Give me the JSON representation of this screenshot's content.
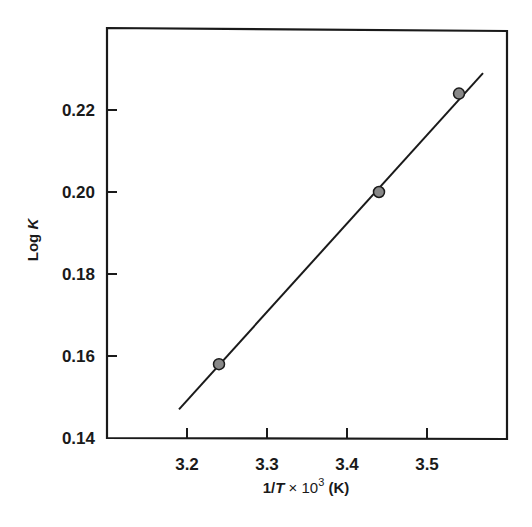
{
  "chart_data": {
    "type": "scatter",
    "title": "",
    "xlabel": "1/T × 10³ (K)",
    "ylabel": "Log K",
    "xlim": [
      3.1,
      3.6
    ],
    "ylim": [
      0.14,
      0.24
    ],
    "xticks": [
      3.2,
      3.3,
      3.4,
      3.5
    ],
    "xtick_labels": [
      "3.2",
      "3.3",
      "3.4",
      "3.5"
    ],
    "yticks": [
      0.14,
      0.16,
      0.18,
      0.2,
      0.22
    ],
    "ytick_labels": [
      "0.14",
      "0.16",
      "0.18",
      "0.20",
      "0.22"
    ],
    "grid": false,
    "legend": null,
    "series": [
      {
        "name": "measured",
        "type": "scatter",
        "x": [
          3.24,
          3.44,
          3.54
        ],
        "y": [
          0.158,
          0.2,
          0.224
        ],
        "marker_color": "#888888"
      },
      {
        "name": "linear fit",
        "type": "line",
        "x": [
          3.19,
          3.57
        ],
        "y": [
          0.147,
          0.229
        ],
        "color": "#1a1a1a"
      }
    ]
  },
  "labels": {
    "x_prefix": "1/",
    "x_var": "T",
    "x_suffix": " × 10",
    "x_exp": "3",
    "x_unit": " (K)",
    "y_prefix": "Log ",
    "y_var": "K"
  }
}
